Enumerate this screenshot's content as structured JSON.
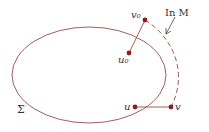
{
  "diagram": {
    "colors": {
      "curve": "#9a4a4a",
      "point": "#8b1f1f",
      "text": "#333333"
    },
    "region_label": "Σ",
    "annotation_label": "In M",
    "points": [
      {
        "id": "v0",
        "label": "v₀"
      },
      {
        "id": "u0",
        "label": "u₀"
      },
      {
        "id": "u",
        "label": "u"
      },
      {
        "id": "v",
        "label": "v"
      }
    ]
  }
}
